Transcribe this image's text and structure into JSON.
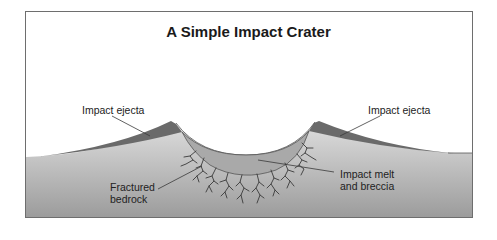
{
  "diagram": {
    "title": "A Simple Impact Crater",
    "labels": {
      "ejecta_left": "Impact ejecta",
      "ejecta_right": "Impact ejecta",
      "bedrock_line1": "Fractured",
      "bedrock_line2": "bedrock",
      "melt_line1": "Impact melt",
      "melt_line2": "and breccia"
    },
    "colors": {
      "sky": "#ffffff",
      "bedrock_top": "#dedede",
      "bedrock_bottom": "#9c9c9c",
      "ejecta": "#6a6a6a",
      "melt_breccia": "#a9a9a9",
      "fractures": "#3a3a3a",
      "leader_lines": "#3a3a3a",
      "border": "#6e6e6e"
    }
  }
}
